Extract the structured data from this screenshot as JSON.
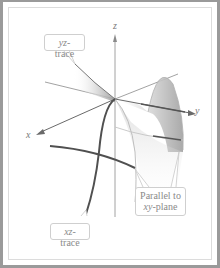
{
  "figure": {
    "type": "3d-saddle-surface-diagram",
    "axes": {
      "x": "x",
      "y": "y",
      "z": "z"
    },
    "callouts": {
      "yz_trace": {
        "italic": "yz",
        "rest": "-trace"
      },
      "xz_trace": {
        "italic": "xz",
        "rest": "-trace"
      },
      "parallel": {
        "line1": "Parallel to",
        "line2_italic": "xy",
        "line2_rest": "-plane"
      }
    },
    "colors": {
      "border": "#9a9a9a",
      "axis": "#7a7a7a",
      "trace": "#555555",
      "surface": "#c8c8c8",
      "callout_text": "#8a8a8a"
    }
  }
}
